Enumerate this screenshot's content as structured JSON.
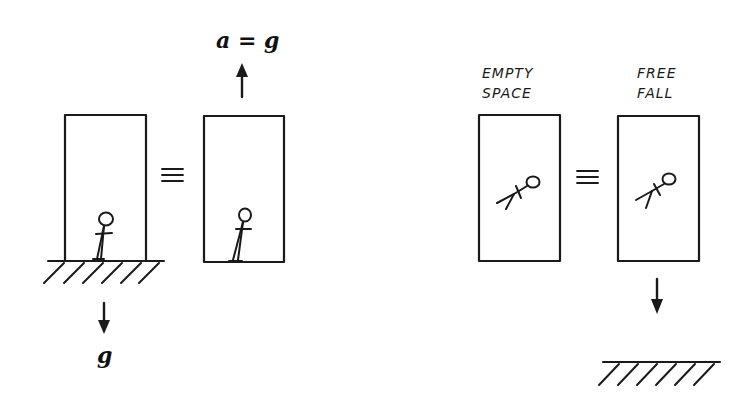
{
  "figure": {
    "panels": [
      {
        "id": "gravity-panel",
        "left_box": {
          "description": "elevator resting on ground in gravity field"
        },
        "equivalence_symbol": "≡",
        "right_box": {
          "description": "elevator accelerating upward"
        },
        "acceleration_label": "a = g",
        "gravity_label": "g"
      },
      {
        "id": "freefall-panel",
        "left_box": {
          "label_line1": "EMPTY",
          "label_line2": "SPACE"
        },
        "equivalence_symbol": "≡",
        "right_box": {
          "label_line1": "FREE",
          "label_line2": "FALL"
        }
      }
    ],
    "colors": {
      "ink": "#1a1a1a",
      "background": "#ffffff"
    }
  }
}
